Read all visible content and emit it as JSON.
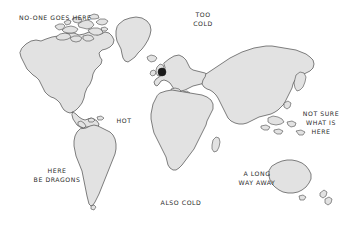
{
  "map": {
    "title": "World Map",
    "background_color": "#ffffff",
    "land_fill_color": "#e2e2e2",
    "land_stroke_color": "#4a4a4a",
    "label_color": "#2b2b2b",
    "marker_color": "#1b1b1b",
    "style": "hand-drawn sketch",
    "labels": [
      {
        "id": "no-one-goes-here",
        "text": "NO-ONE GOES HERE",
        "region": "Arctic / northern Canada",
        "x": 19,
        "y": 14,
        "align": "left"
      },
      {
        "id": "too-cold",
        "text": "TOO\nCOLD",
        "region": "Arctic / Svalbard north",
        "x": 186,
        "y": 11,
        "align": "center"
      },
      {
        "id": "hot",
        "text": "HOT",
        "region": "Atlantic near Africa",
        "x": 124,
        "y": 117,
        "align": "center"
      },
      {
        "id": "not-sure-what-is-here",
        "text": "NOT SURE\nWHAT IS\nHERE",
        "region": "East Asia / Pacific",
        "x": 297,
        "y": 110,
        "align": "center"
      },
      {
        "id": "here-be-dragons",
        "text": "HERE\nBE DRAGONS",
        "region": "South Atlantic / South America west",
        "x": 38,
        "y": 167,
        "align": "center"
      },
      {
        "id": "a-long-way-away",
        "text": "A LONG\nWAY AWAY",
        "region": "Indian Ocean near Australia",
        "x": 239,
        "y": 170,
        "align": "center"
      },
      {
        "id": "also-cold",
        "text": "ALSO COLD",
        "region": "Southern Ocean / Antarctica",
        "x": 160,
        "y": 199,
        "align": "center"
      }
    ],
    "markers": [
      {
        "id": "location-marker",
        "label": "",
        "region": "United Kingdom / North Sea",
        "x": 162,
        "y": 72,
        "radius": 4
      }
    ],
    "landmasses": [
      "North America",
      "Greenland",
      "Arctic islands",
      "South America",
      "Europe",
      "Africa",
      "Asia",
      "Australia",
      "New Zealand",
      "Japan",
      "Indonesia",
      "Madagascar",
      "British Isles",
      "Iceland"
    ]
  }
}
